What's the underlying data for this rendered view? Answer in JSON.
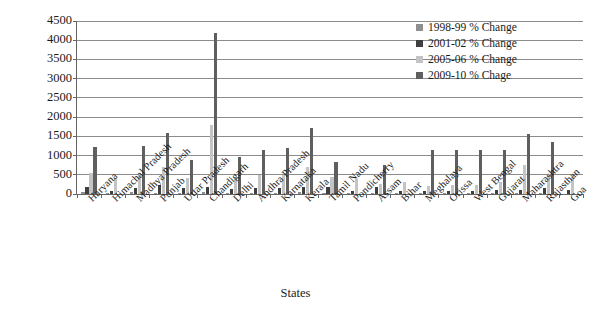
{
  "chart_data": {
    "type": "bar",
    "title": "",
    "xlabel": "States",
    "ylabel": "% Change",
    "ylim": [
      0,
      4500
    ],
    "ytick_step": 500,
    "yticks": [
      0,
      500,
      1000,
      1500,
      2000,
      2500,
      3000,
      3500,
      4000,
      4500
    ],
    "grid": true,
    "legend_position": "top-right",
    "categories": [
      "Haryana",
      "Himachal Pradesh",
      "Madhya Pradesh",
      "Punjab",
      "Uttar Pradesh",
      "Chandigarh",
      "Delhi",
      "Andhra Pradesh",
      "Karnataka",
      "Kerala",
      "Tamil Nadu",
      "Pondicherry",
      "Assam",
      "Bihar",
      "Meghalaya",
      "Orissa",
      "West Bengal",
      "Gujarat",
      "Maharashtra",
      "Rajasthan",
      "Goa"
    ],
    "series": [
      {
        "name": "1998-99 % Change",
        "color": "#8f8f8f",
        "values": [
          40,
          20,
          30,
          25,
          25,
          30,
          20,
          20,
          25,
          30,
          20,
          15,
          20,
          15,
          20,
          20,
          20,
          20,
          25,
          20,
          0
        ]
      },
      {
        "name": "2001-02 % Change",
        "color": "#3f3f3f",
        "values": [
          175,
          70,
          150,
          225,
          140,
          180,
          130,
          135,
          135,
          175,
          160,
          60,
          180,
          60,
          60,
          75,
          75,
          90,
          95,
          150,
          100
        ]
      },
      {
        "name": "2005-06 % Change",
        "color": "#c4c4c4",
        "values": [
          540,
          415,
          540,
          690,
          395,
          1780,
          430,
          490,
          480,
          700,
          420,
          380,
          240,
          300,
          200,
          230,
          230,
          300,
          740,
          500,
          500
        ]
      },
      {
        "name": "2009-10 % Chage",
        "color": "#5f5f5f",
        "values": [
          1210,
          0,
          1230,
          1570,
          880,
          4170,
          950,
          1130,
          1180,
          1700,
          810,
          0,
          730,
          0,
          1130,
          1130,
          1140,
          1130,
          1550,
          1350,
          0
        ]
      }
    ]
  },
  "legend": {
    "items": [
      {
        "label": "1998-99 % Change",
        "swatch_class": "s0"
      },
      {
        "label": "2001-02 % Change",
        "swatch_class": "s1"
      },
      {
        "label": "2005-06 % Change",
        "swatch_class": "s2"
      },
      {
        "label": "2009-10 % Chage",
        "swatch_class": "s3"
      }
    ]
  }
}
